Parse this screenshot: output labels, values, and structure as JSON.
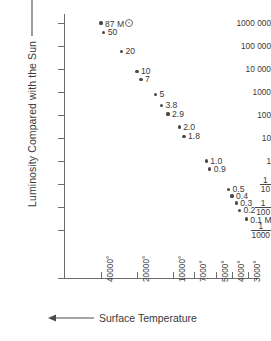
{
  "chart_data": {
    "type": "scatter",
    "title": "",
    "xlabel": "Surface Temperature",
    "ylabel": "Luminosity Compared with the Sun",
    "xlabel_arrow": "left-arrow",
    "ylabel_arrow": "up-arrow",
    "grid": false,
    "legend": "none",
    "x_tick_labels": [
      "40000°",
      "20000°",
      "10000°",
      "7000°",
      "5000°",
      "4000°",
      "3000°"
    ],
    "x_tick_values": [
      40000,
      20000,
      10000,
      7000,
      5000,
      4000,
      3000
    ],
    "x_axis_direction": "decreasing",
    "y_tick_labels": [
      "1000 000",
      "100 000",
      "10 000",
      "1000",
      "100",
      "10",
      "1",
      "1/10",
      "1/100",
      "1/1000"
    ],
    "y_tick_values": [
      1000000,
      100000,
      10000,
      1000,
      100,
      10,
      1,
      0.1,
      0.01,
      0.001
    ],
    "y_scale": "log",
    "point_unit_symbol": "M☉",
    "points": [
      {
        "label": "87 M",
        "mass": 87,
        "has_sun_symbol": true,
        "temperature": 40000,
        "luminosity": 1000000
      },
      {
        "label": "50",
        "mass": 50,
        "has_sun_symbol": false,
        "temperature": 38000,
        "luminosity": 400000
      },
      {
        "label": "20",
        "mass": 20,
        "has_sun_symbol": false,
        "temperature": 27000,
        "luminosity": 60000
      },
      {
        "label": "10",
        "mass": 10,
        "has_sun_symbol": false,
        "temperature": 20000,
        "luminosity": 8000
      },
      {
        "label": "7",
        "mass": 7,
        "has_sun_symbol": false,
        "temperature": 18500,
        "luminosity": 3500
      },
      {
        "label": "5",
        "mass": 5,
        "has_sun_symbol": false,
        "temperature": 14000,
        "luminosity": 800
      },
      {
        "label": "3.8",
        "mass": 3.8,
        "has_sun_symbol": false,
        "temperature": 12500,
        "luminosity": 250
      },
      {
        "label": "2.9",
        "mass": 2.9,
        "has_sun_symbol": false,
        "temperature": 11000,
        "luminosity": 110
      },
      {
        "label": "2.0",
        "mass": 2.0,
        "has_sun_symbol": false,
        "temperature": 9000,
        "luminosity": 30
      },
      {
        "label": "1.8",
        "mass": 1.8,
        "has_sun_symbol": false,
        "temperature": 8300,
        "luminosity": 12
      },
      {
        "label": "1.0",
        "mass": 1.0,
        "has_sun_symbol": false,
        "temperature": 5800,
        "luminosity": 1
      },
      {
        "label": "0.9",
        "mass": 0.9,
        "has_sun_symbol": false,
        "temperature": 5500,
        "luminosity": 0.45
      },
      {
        "label": "0.5",
        "mass": 0.5,
        "has_sun_symbol": false,
        "temperature": 4200,
        "luminosity": 0.06
      },
      {
        "label": "0.4",
        "mass": 0.4,
        "has_sun_symbol": false,
        "temperature": 4000,
        "luminosity": 0.03
      },
      {
        "label": "0.3",
        "mass": 0.3,
        "has_sun_symbol": false,
        "temperature": 3700,
        "luminosity": 0.015
      },
      {
        "label": "0.2",
        "mass": 0.2,
        "has_sun_symbol": false,
        "temperature": 3500,
        "luminosity": 0.007
      },
      {
        "label": "0.1 M",
        "mass": 0.1,
        "has_sun_symbol": true,
        "temperature": 3100,
        "luminosity": 0.003
      }
    ]
  },
  "colors": {
    "axis": "#6d6d6d",
    "text": "#3a3a3a",
    "point": "#4a4a4a",
    "background": "#ffffff"
  }
}
